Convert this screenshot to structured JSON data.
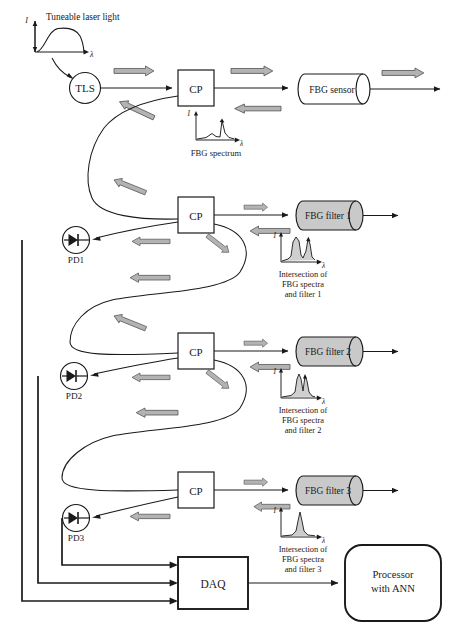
{
  "figure": {
    "kind": "optical-fiber-sensor-system-block-diagram",
    "caption": ""
  },
  "source": {
    "label_I": "I",
    "label_lambda": "λ"
  },
  "nodes": {
    "tls": {
      "label": "TLS",
      "title": "Tuneable laser light"
    },
    "couplers": [
      {
        "id": "cp1",
        "label": "CP"
      },
      {
        "id": "cp2",
        "label": "CP"
      },
      {
        "id": "cp3",
        "label": "CP"
      },
      {
        "id": "cp4",
        "label": "CP"
      }
    ],
    "devices": [
      {
        "id": "sensor",
        "label": "FBG sensor",
        "fill": "#ffffff"
      },
      {
        "id": "filter1",
        "label": "FBG filter 1",
        "fill": "#c9c9c9"
      },
      {
        "id": "filter2",
        "label": "FBG filter 2",
        "fill": "#c9c9c9"
      },
      {
        "id": "filter3",
        "label": "FBG filter 3",
        "fill": "#c9c9c9"
      }
    ],
    "photodiodes": [
      {
        "id": "pd1",
        "label": "PD1"
      },
      {
        "id": "pd2",
        "label": "PD2"
      },
      {
        "id": "pd3",
        "label": "PD3"
      }
    ],
    "daq": {
      "label": "DAQ"
    },
    "processor": {
      "line1": "Processor",
      "line2": "with ANN"
    }
  },
  "insets": [
    {
      "id": "fbg-spectrum",
      "caption_lines": [
        "FBG spectrum"
      ],
      "axis_y": "I",
      "axis_x": "λ"
    },
    {
      "id": "intersection-1",
      "caption_lines": [
        "Intersection of",
        "FBG spectra",
        "and filter 1"
      ],
      "axis_y": "I",
      "axis_x": "λ"
    },
    {
      "id": "intersection-2",
      "caption_lines": [
        "Intersection of",
        "FBG spectra",
        "and filter 2"
      ],
      "axis_y": "I",
      "axis_x": "λ"
    },
    {
      "id": "intersection-3",
      "caption_lines": [
        "Intersection of",
        "FBG spectra",
        "and filter 3"
      ],
      "axis_y": "I",
      "axis_x": "λ"
    }
  ],
  "colors": {
    "line": "#1a1a1a",
    "arrow_fill": "#b3b3b3",
    "arrow_stroke": "#4d4d4d",
    "device_fill": "#c9c9c9",
    "sensor_fill": "#ffffff",
    "inset_fill": "#bfbfbf"
  }
}
